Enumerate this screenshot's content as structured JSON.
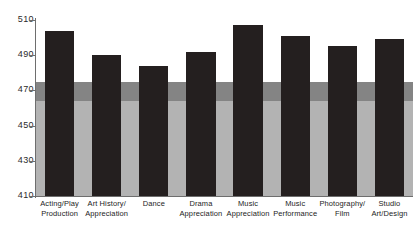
{
  "chart_data": {
    "type": "bar",
    "title": "",
    "subtitle": "",
    "xlabel": "",
    "ylabel": "",
    "ylim": [
      410,
      510
    ],
    "yticks": [
      410,
      430,
      450,
      470,
      490,
      510
    ],
    "ytick_labels": [
      "410",
      "430",
      "450",
      "470",
      "490",
      "510"
    ],
    "grid": false,
    "legend": null,
    "bar_color": "#241f1f",
    "categories": [
      "Acting/Play Production",
      "Art History/ Appreciation",
      "Dance",
      "Drama Appreciation",
      "Music Appreciation",
      "Music Performance",
      "Photography/ Film",
      "Studio Art/Design"
    ],
    "category_lines": [
      [
        "Acting/Play",
        "Production"
      ],
      [
        "Art History/",
        "Appreciation"
      ],
      [
        "Dance",
        ""
      ],
      [
        "Drama",
        "Appreciation"
      ],
      [
        "Music",
        "Appreciation"
      ],
      [
        "Music",
        "Performance"
      ],
      [
        "Photography/",
        "Film"
      ],
      [
        "Studio",
        "Art/Design"
      ]
    ],
    "values": [
      504,
      490,
      484,
      492,
      507,
      501,
      495,
      499
    ],
    "bands": [
      {
        "name": "lower-reference-band",
        "from": 410,
        "to": 464,
        "color": "#b3b3b3"
      },
      {
        "name": "upper-reference-band",
        "from": 464,
        "to": 475,
        "color": "#848484"
      }
    ]
  }
}
